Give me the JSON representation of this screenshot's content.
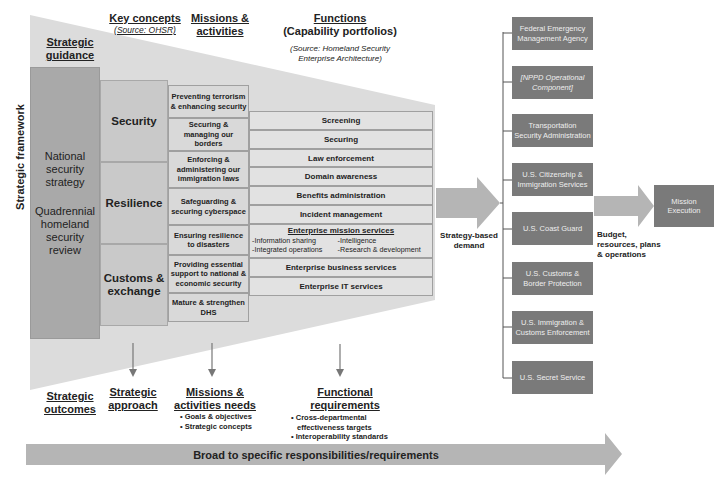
{
  "colors": {
    "funnel_bg": "#dcdcdc",
    "nss_column": "#a9a9a9",
    "key_concepts": "#c9c9c9",
    "missions": "#d9d9d9",
    "functions": "#e2e2e2",
    "agency_box": "#7a7a7a",
    "arrow": "#b5b5b5",
    "connector": "#555555"
  },
  "headers": {
    "strategic_guidance": "Strategic guidance",
    "key_concepts": "Key concepts",
    "key_concepts_source": "(Source: OHSR)",
    "missions_activities": "Missions & activities",
    "functions": "Functions",
    "capability_portfolios": "(Capability portfolios)",
    "functions_source": "(Source: Homeland Security Enterprise Architecture)"
  },
  "side_label": "Strategic framework",
  "strategic_guidance_column": [
    "National security strategy",
    "Quadrennial homeland security review"
  ],
  "key_concepts": [
    "Security",
    "Resilience",
    "Customs & exchange"
  ],
  "missions": [
    "Preventing terrorism & enhancing security",
    "Securing & managing our borders",
    "Enforcing & administering our immigration laws",
    "Safeguarding & securing cyberspace",
    "Ensuring resilience to disasters",
    "Providing essential support to national & economic security",
    "Mature & strengthen DHS"
  ],
  "functions": [
    "Screening",
    "Securing",
    "Law enforcement",
    "Domain awareness",
    "Benefits administration",
    "Incident management"
  ],
  "enterprise_mission_services": {
    "title": "Enterprise mission services",
    "items": [
      "-Information sharing",
      "-Intelligence",
      "-Integrated operations",
      "-Research & development"
    ]
  },
  "enterprise_business_services": "Enterprise business services",
  "enterprise_it_services": "Enterprise IT services",
  "strategy_demand_label": "Strategy-based demand",
  "agencies": [
    "Federal Emergency Management Agency",
    "[NPPD Operational Component]",
    "Transportation Security Administration",
    "U.S. Citizenship & Immigration Services",
    "U.S. Coast Guard",
    "U.S. Customs & Border Protection",
    "U.S. Immigration & Customs Enforcement",
    "U.S. Secret Service"
  ],
  "budget_label": "Budget, resources, plans & operations",
  "mission_execution": "Mission Execution",
  "outcomes": {
    "strategic_outcomes": "Strategic outcomes",
    "strategic_approach": "Strategic approach",
    "missions_needs_title": "Missions & activities needs",
    "missions_needs_bullets": [
      "• Goals & objectives",
      "• Strategic concepts"
    ],
    "functional_req_title": "Functional requirements",
    "functional_req_bullets": [
      "• Cross-departmental",
      "effectiveness targets",
      "• Interoperability standards"
    ]
  },
  "broad_arrow_label": "Broad to specific responsibilities/requirements"
}
